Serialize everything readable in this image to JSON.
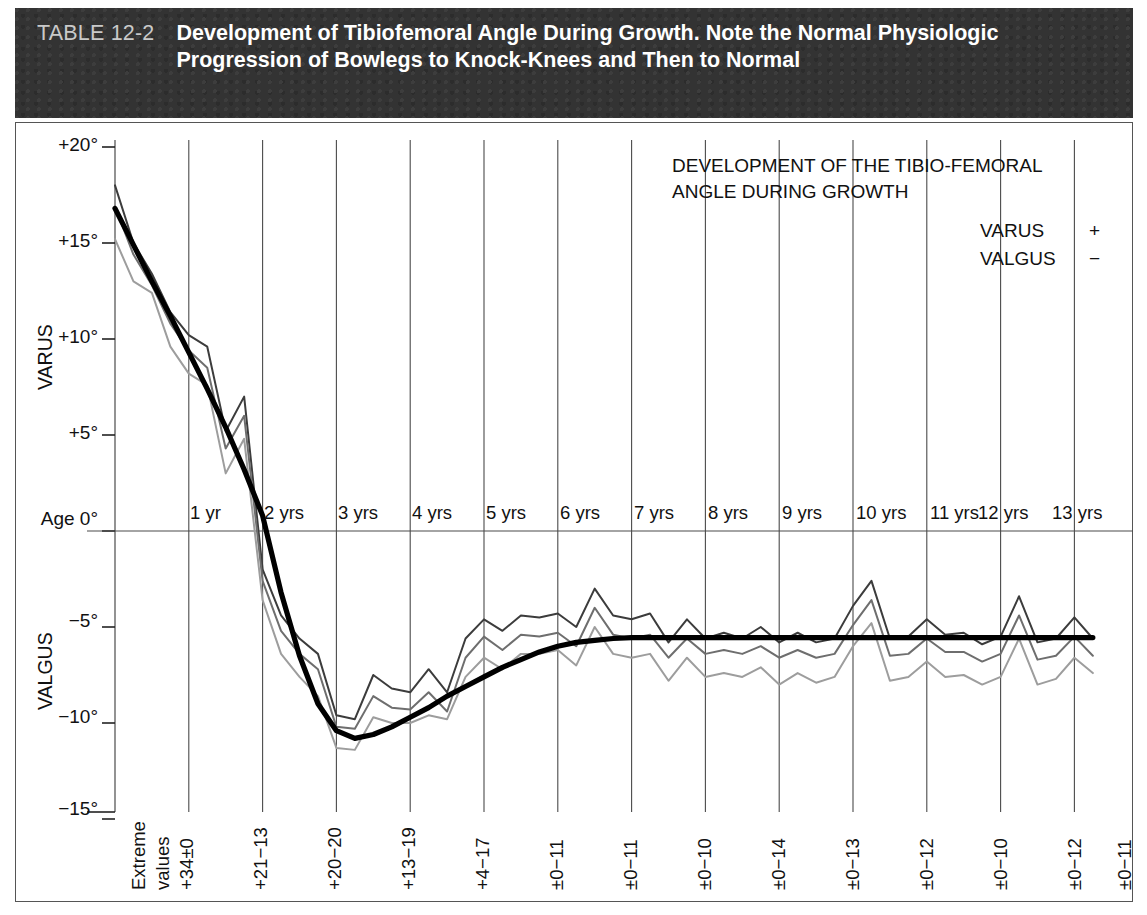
{
  "banner": {
    "tag": "TABLE 12-2",
    "title": "Development of Tibiofemoral Angle During Growth. Note the Normal Physiologic Progression of Bowlegs to Knock-Knees and Then to Normal"
  },
  "legend": {
    "line1": "DEVELOPMENT OF THE TIBIO-FEMORAL",
    "line2": "ANGLE DURING GROWTH",
    "rows": [
      {
        "label": "VARUS",
        "sign": "+"
      },
      {
        "label": "VALGUS",
        "sign": "−"
      }
    ]
  },
  "axis": {
    "y_title_top": "VARUS",
    "y_title_bottom": "VALGUS",
    "y_ticks": [
      "+20°",
      "+15°",
      "+10°",
      "+5°",
      "Age 0°",
      "−5°",
      "−10°",
      "−15°"
    ],
    "extreme_label_line1": "Extreme",
    "extreme_label_line2": "values"
  },
  "chart_data": {
    "type": "line",
    "xlabel": "Age",
    "ylabel": "Tibiofemoral angle (degrees)",
    "ylim": [
      -15,
      20
    ],
    "xlim": [
      0,
      13.5
    ],
    "grid": true,
    "legend_position": "top-right",
    "yticks": [
      20,
      15,
      10,
      5,
      0,
      -5,
      -10,
      -15
    ],
    "ytick_labels": [
      "+20°",
      "+15°",
      "+10°",
      "+5°",
      "Age 0°",
      "−5°",
      "−10°",
      "−15°"
    ],
    "age_labels": [
      "1 yr",
      "2 yrs",
      "3 yrs",
      "4 yrs",
      "5 yrs",
      "6 yrs",
      "7 yrs",
      "8 yrs",
      "9 yrs",
      "10 yrs",
      "11 yrs",
      "12 yrs",
      "13 yrs"
    ],
    "extreme_values": [
      "+34±0",
      "+21−13",
      "+20−20",
      "+13−19",
      "+4−17",
      "±0−11",
      "±0−11",
      "±0−10",
      "±0−14",
      "±0−13",
      "±0−12",
      "±0−10",
      "±0−12",
      "±0−11"
    ],
    "x": [
      0.0,
      0.25,
      0.5,
      0.75,
      1.0,
      1.25,
      1.5,
      1.75,
      2.0,
      2.25,
      2.5,
      2.75,
      3.0,
      3.25,
      3.5,
      3.75,
      4.0,
      4.25,
      4.5,
      4.75,
      5.0,
      5.25,
      5.5,
      5.75,
      6.0,
      6.25,
      6.5,
      6.75,
      7.0,
      7.25,
      7.5,
      7.75,
      8.0,
      8.25,
      8.5,
      8.75,
      9.0,
      9.25,
      9.5,
      9.75,
      10.0,
      10.25,
      10.5,
      10.75,
      11.0,
      11.25,
      11.5,
      11.75,
      12.0,
      12.25,
      12.5,
      12.75,
      13.0,
      13.25
    ],
    "series": [
      {
        "name": "upper-range",
        "color": "#3c3c3c",
        "values": [
          18.0,
          15.0,
          13.4,
          11.4,
          10.2,
          9.6,
          5.2,
          7.0,
          -2.0,
          -4.4,
          -5.6,
          -6.4,
          -9.6,
          -9.8,
          -7.5,
          -8.2,
          -8.4,
          -7.2,
          -8.4,
          -5.6,
          -4.6,
          -5.2,
          -4.4,
          -4.5,
          -4.3,
          -5.0,
          -3.0,
          -4.4,
          -4.6,
          -4.3,
          -5.8,
          -4.6,
          -5.6,
          -5.3,
          -5.6,
          -5.0,
          -5.8,
          -5.3,
          -5.8,
          -5.6,
          -3.9,
          -2.6,
          -5.6,
          -5.5,
          -4.6,
          -5.4,
          -5.3,
          -5.9,
          -5.5,
          -3.4,
          -5.8,
          -5.6,
          -4.5,
          -5.6
        ]
      },
      {
        "name": "mid-range",
        "color": "#6e6e6e",
        "values": [
          16.9,
          14.4,
          12.8,
          10.8,
          9.4,
          8.5,
          4.3,
          6.0,
          -2.6,
          -5.2,
          -6.4,
          -7.2,
          -10.2,
          -10.3,
          -8.6,
          -9.2,
          -9.3,
          -8.4,
          -9.4,
          -6.6,
          -5.5,
          -6.2,
          -5.4,
          -5.5,
          -5.3,
          -6.0,
          -4.0,
          -5.4,
          -5.6,
          -5.4,
          -6.6,
          -5.6,
          -6.4,
          -6.2,
          -6.4,
          -6.0,
          -6.6,
          -6.2,
          -6.6,
          -6.4,
          -4.9,
          -3.6,
          -6.5,
          -6.4,
          -5.6,
          -6.3,
          -6.3,
          -6.8,
          -6.4,
          -4.4,
          -6.7,
          -6.5,
          -5.5,
          -6.5
        ]
      },
      {
        "name": "lower-range",
        "color": "#9d9d9d",
        "values": [
          15.2,
          13.0,
          12.4,
          9.6,
          8.2,
          7.6,
          3.0,
          4.8,
          -3.6,
          -6.4,
          -7.6,
          -8.6,
          -11.3,
          -11.4,
          -9.7,
          -10.0,
          -10.0,
          -9.6,
          -9.8,
          -7.6,
          -6.6,
          -7.2,
          -6.4,
          -6.4,
          -6.2,
          -7.0,
          -5.0,
          -6.4,
          -6.6,
          -6.4,
          -7.8,
          -6.6,
          -7.6,
          -7.4,
          -7.6,
          -7.1,
          -8.0,
          -7.4,
          -7.9,
          -7.6,
          -6.0,
          -4.8,
          -7.8,
          -7.6,
          -6.8,
          -7.6,
          -7.5,
          -8.0,
          -7.6,
          -5.6,
          -8.0,
          -7.7,
          -6.6,
          -7.4
        ]
      },
      {
        "name": "mean-trend",
        "color": "#000000",
        "values": [
          16.8,
          14.9,
          13.0,
          11.2,
          9.3,
          7.4,
          5.4,
          3.2,
          0.8,
          -3.2,
          -6.5,
          -9.0,
          -10.4,
          -10.8,
          -10.6,
          -10.2,
          -9.7,
          -9.2,
          -8.6,
          -8.1,
          -7.6,
          -7.1,
          -6.7,
          -6.3,
          -6.0,
          -5.8,
          -5.7,
          -5.6,
          -5.55,
          -5.55,
          -5.55,
          -5.55,
          -5.55,
          -5.55,
          -5.55,
          -5.55,
          -5.55,
          -5.55,
          -5.55,
          -5.55,
          -5.55,
          -5.55,
          -5.55,
          -5.55,
          -5.55,
          -5.55,
          -5.55,
          -5.55,
          -5.55,
          -5.55,
          -5.55,
          -5.55,
          -5.55,
          -5.55
        ]
      }
    ]
  }
}
